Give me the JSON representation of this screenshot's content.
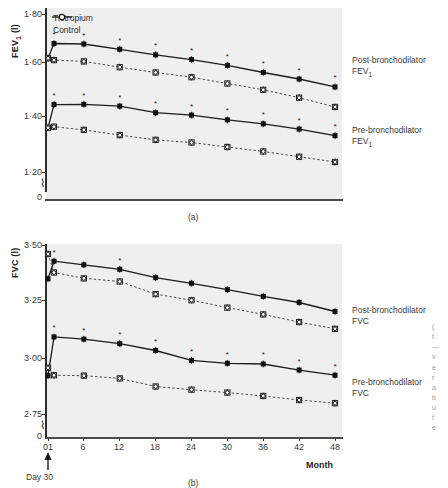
{
  "figure": {
    "panel_a_tag": "(a)",
    "panel_b_tag": "(b)"
  },
  "legend": {
    "items": [
      {
        "label": "Tiotropium",
        "marker": "filled-circle",
        "line": "solid"
      },
      {
        "label": "Control",
        "marker": "open-circle",
        "line": "dashed"
      }
    ]
  },
  "annotations": {
    "post_fev1_line1": "Post-bronchodilator",
    "post_fev1_line2": "FEV",
    "post_fev1_sub": "1",
    "pre_fev1_line1": "Pre-bronchodilator",
    "pre_fev1_line2": "FEV",
    "pre_fev1_sub": "1",
    "post_fvc_line1": "Post-bronchodilator",
    "post_fvc_line2": "FVC",
    "pre_fvc_line1": "Pre-bronchodilator",
    "pre_fvc_line2": "FVC",
    "day30": "Day 30",
    "month_axis": "Month",
    "significance_marker": "*"
  },
  "chart_data": [
    {
      "type": "line",
      "panel": "(a)",
      "title": "",
      "ylabel": "FEV1 (l)",
      "ylabel_text": "FEV",
      "ylabel_sub": "1",
      "ylabel_unit": " (l)",
      "xlabel": "",
      "ylim": [
        1.13,
        1.8
      ],
      "yticks": [
        1.2,
        1.4,
        1.6,
        1.8
      ],
      "ytick_labels": [
        "1·20",
        "1·40",
        "1·60",
        "1·80"
      ],
      "axis_break": true,
      "axis_zero_label": "0",
      "x": [
        0,
        1,
        6,
        12,
        18,
        24,
        30,
        36,
        42,
        48
      ],
      "xticks": [
        0,
        6,
        12,
        18,
        24,
        30,
        36,
        42,
        48
      ],
      "xtick_labels": [
        "01",
        "6",
        "12",
        "18",
        "24",
        "30",
        "36",
        "42",
        "48"
      ],
      "grid": false,
      "legend_position": "top-left",
      "series": [
        {
          "name": "Post-bronchodilator FEV1 — Tiotropium",
          "marker": "filled-circle",
          "line": "solid",
          "values": [
            1.632,
            1.688,
            1.686,
            1.666,
            1.645,
            1.627,
            1.605,
            1.578,
            1.553,
            1.523
          ],
          "starred": [
            false,
            true,
            true,
            true,
            true,
            true,
            true,
            true,
            true,
            true
          ]
        },
        {
          "name": "Post-bronchodilator FEV1 — Control",
          "marker": "open-circle",
          "line": "dashed",
          "values": [
            1.632,
            1.625,
            1.62,
            1.598,
            1.578,
            1.56,
            1.536,
            1.512,
            1.482,
            1.447
          ],
          "starred": [
            false,
            false,
            false,
            false,
            false,
            false,
            false,
            false,
            false,
            false
          ]
        },
        {
          "name": "Pre-bronchodilator FEV1 — Tiotropium",
          "marker": "filled-circle",
          "line": "solid",
          "values": [
            1.368,
            1.456,
            1.457,
            1.45,
            1.425,
            1.416,
            1.398,
            1.383,
            1.363,
            1.338
          ],
          "starred": [
            false,
            true,
            true,
            true,
            true,
            true,
            true,
            true,
            true,
            true
          ]
        },
        {
          "name": "Pre-bronchodilator FEV1 — Control",
          "marker": "open-circle",
          "line": "dashed",
          "values": [
            1.368,
            1.372,
            1.36,
            1.34,
            1.322,
            1.312,
            1.295,
            1.278,
            1.258,
            1.238
          ],
          "starred": [
            false,
            false,
            false,
            false,
            false,
            false,
            false,
            false,
            false,
            false
          ]
        }
      ]
    },
    {
      "type": "line",
      "panel": "(b)",
      "title": "",
      "ylabel": "FVC (l)",
      "ylabel_text": "FVC",
      "ylabel_unit": " (l)",
      "xlabel": "Month",
      "ylim": [
        2.68,
        3.5
      ],
      "yticks": [
        2.75,
        3.0,
        3.25,
        3.5
      ],
      "ytick_labels": [
        "2·75",
        "3·00",
        "3·25",
        "3·50"
      ],
      "axis_break": true,
      "axis_zero_label": "0",
      "x": [
        0,
        1,
        6,
        12,
        18,
        24,
        30,
        36,
        42,
        48
      ],
      "xticks": [
        0,
        6,
        12,
        18,
        24,
        30,
        36,
        42,
        48
      ],
      "xtick_labels": [
        "01",
        "6",
        "12",
        "18",
        "24",
        "30",
        "36",
        "42",
        "48"
      ],
      "grid": false,
      "legend_position": "none",
      "series": [
        {
          "name": "Post-bronchodilator FVC — Tiotropium",
          "marker": "filled-circle",
          "line": "solid",
          "values": [
            3.35,
            3.428,
            3.412,
            3.392,
            3.355,
            3.33,
            3.302,
            3.272,
            3.245,
            3.205
          ],
          "starred": [
            false,
            true,
            false,
            true,
            false,
            false,
            false,
            false,
            false,
            false
          ]
        },
        {
          "name": "Post-bronchodilator FVC — Control",
          "marker": "open-circle",
          "line": "dashed",
          "values": [
            3.46,
            3.378,
            3.352,
            3.338,
            3.282,
            3.255,
            3.222,
            3.192,
            3.158,
            3.128
          ],
          "starred": [
            false,
            false,
            false,
            false,
            false,
            false,
            false,
            false,
            false,
            false
          ]
        },
        {
          "name": "Pre-bronchodilator FVC — Tiotropium",
          "marker": "filled-circle",
          "line": "solid",
          "values": [
            2.92,
            3.092,
            3.082,
            3.062,
            3.032,
            2.988,
            2.975,
            2.972,
            2.945,
            2.922
          ],
          "starred": [
            false,
            true,
            true,
            true,
            true,
            true,
            true,
            true,
            true,
            true
          ]
        },
        {
          "name": "Pre-bronchodilator FVC — Control",
          "marker": "open-circle",
          "line": "dashed",
          "values": [
            2.955,
            2.922,
            2.92,
            2.908,
            2.872,
            2.858,
            2.845,
            2.83,
            2.812,
            2.798
          ],
          "starred": [
            false,
            false,
            false,
            false,
            false,
            false,
            false,
            false,
            false,
            false
          ]
        }
      ]
    }
  ],
  "edge_caption": {
    "line1": "(",
    "line2": "t",
    "line3": "—",
    "line4": "v",
    "line5": "e",
    "line6": "r",
    "line7": "a",
    "line8": "b",
    "line9": "u",
    "line10": "t",
    "line11": "e"
  }
}
